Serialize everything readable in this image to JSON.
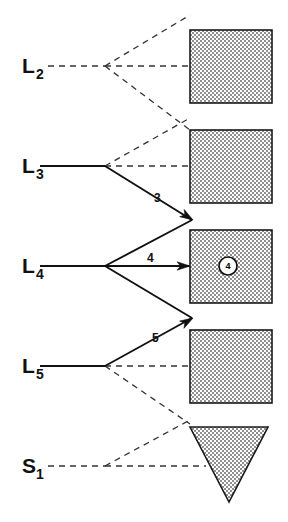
{
  "diagram": {
    "background_color": "#ffffff",
    "ink_color": "#111111",
    "fill_pattern": "checkerboard-stipple",
    "fill_color": "#a8a8a8",
    "nodes": [
      {
        "id": "L2",
        "base": "L",
        "subscript": "2",
        "x": 22,
        "y": 73,
        "junction_x": 105,
        "junction_y": 66
      },
      {
        "id": "L3",
        "base": "L",
        "subscript": "3",
        "x": 22,
        "y": 173,
        "junction_x": 105,
        "junction_y": 166
      },
      {
        "id": "L4",
        "base": "L",
        "subscript": "4",
        "x": 22,
        "y": 273,
        "junction_x": 105,
        "junction_y": 266
      },
      {
        "id": "L5",
        "base": "L",
        "subscript": "5",
        "x": 22,
        "y": 373,
        "junction_x": 105,
        "junction_y": 366
      },
      {
        "id": "S1",
        "base": "S",
        "subscript": "1",
        "x": 22,
        "y": 473,
        "junction_x": 105,
        "junction_y": 466
      }
    ],
    "shapes": [
      {
        "id": "square-1",
        "type": "square",
        "x": 190,
        "y": 30,
        "width": 82,
        "height": 73
      },
      {
        "id": "square-2",
        "type": "square",
        "x": 190,
        "y": 130,
        "width": 82,
        "height": 73
      },
      {
        "id": "square-3",
        "type": "square",
        "x": 190,
        "y": 230,
        "width": 82,
        "height": 73
      },
      {
        "id": "square-4",
        "type": "square",
        "x": 190,
        "y": 330,
        "width": 82,
        "height": 73
      },
      {
        "id": "triangle-1",
        "type": "triangle-down",
        "x": 190,
        "y": 427,
        "width": 78,
        "height": 75
      }
    ],
    "edge_labels": [
      {
        "id": "edge-label-3",
        "text": "3",
        "x": 154,
        "y": 202
      },
      {
        "id": "edge-label-4",
        "text": "4",
        "x": 147,
        "y": 262
      },
      {
        "id": "edge-label-5",
        "text": "5",
        "x": 152,
        "y": 342
      }
    ],
    "markers": [
      {
        "id": "circled-4",
        "text": "4",
        "cx": 228,
        "cy": 266,
        "r": 9
      }
    ],
    "solid_edges": [
      {
        "id": "edge-L3-in",
        "points": "40,166 105,166"
      },
      {
        "id": "edge-L3-to-square3",
        "points": "105,166 192,220"
      },
      {
        "id": "edge-L4-in",
        "points": "40,266 105,266"
      },
      {
        "id": "edge-L4-to-square3",
        "points": "105,266 189,266"
      },
      {
        "id": "edge-L4-up-to-square3",
        "points": "105,266 192,220"
      },
      {
        "id": "edge-L4-down-to-square3",
        "points": "105,266 192,318"
      },
      {
        "id": "edge-L5-in",
        "points": "40,366 105,366"
      },
      {
        "id": "edge-L5-to-square3",
        "points": "105,366 192,318"
      }
    ],
    "dashed_edges": [
      {
        "id": "edge-L2-in",
        "points": "48,66 105,66"
      },
      {
        "id": "edge-L2-up",
        "points": "105,66 190,15"
      },
      {
        "id": "edge-L2-mid",
        "points": "105,66 190,66"
      },
      {
        "id": "edge-L2-down",
        "points": "105,66 190,130"
      },
      {
        "id": "edge-L3-up",
        "points": "105,166 190,118"
      },
      {
        "id": "edge-L3-mid",
        "points": "105,166 190,166"
      },
      {
        "id": "edge-L5-mid",
        "points": "105,366 190,366"
      },
      {
        "id": "edge-L5-down",
        "points": "105,366 190,424"
      },
      {
        "id": "edge-S1-in",
        "points": "48,466 105,466"
      },
      {
        "id": "edge-S1-up",
        "points": "105,466 190,420"
      },
      {
        "id": "edge-S1-mid",
        "points": "105,466 206,466"
      }
    ],
    "arrow_heads": [
      {
        "id": "arrowhead-3",
        "x": 193,
        "y": 220,
        "angle": 32
      },
      {
        "id": "arrowhead-4",
        "x": 190,
        "y": 266,
        "angle": 0
      },
      {
        "id": "arrowhead-5",
        "x": 193,
        "y": 318,
        "angle": -31
      }
    ]
  }
}
